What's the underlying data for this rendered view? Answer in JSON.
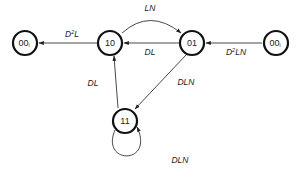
{
  "diagram": {
    "type": "state-transition-diagram",
    "nodes": [
      {
        "id": "n00_left",
        "label": "00",
        "subscript": "i",
        "x": 25,
        "y": 43
      },
      {
        "id": "n10",
        "label": "10",
        "subscript": "",
        "x": 110,
        "y": 43
      },
      {
        "id": "n01",
        "label": "01",
        "subscript": "",
        "x": 192,
        "y": 43
      },
      {
        "id": "n00_right",
        "label": "00",
        "subscript": "i",
        "x": 276,
        "y": 43
      },
      {
        "id": "n11",
        "label": "11",
        "subscript": "",
        "x": 125,
        "y": 121
      }
    ],
    "edges": [
      {
        "from": "10",
        "to": "00_i (left)",
        "label_base": "D",
        "label_sup": "2",
        "label_rest": "L"
      },
      {
        "from": "10",
        "to": "01",
        "label_base": "LN",
        "label_sup": "",
        "label_rest": "",
        "curved": true
      },
      {
        "from": "01",
        "to": "10",
        "label_base": "DL",
        "label_sup": "",
        "label_rest": ""
      },
      {
        "from": "00_i (right)",
        "to": "01",
        "label_base": "D",
        "label_sup": "2",
        "label_rest": "LN"
      },
      {
        "from": "01",
        "to": "11",
        "label_base": "DLN",
        "label_sup": "",
        "label_rest": ""
      },
      {
        "from": "11",
        "to": "10",
        "label_base": "DL",
        "label_sup": "",
        "label_rest": ""
      },
      {
        "from": "11",
        "to": "11",
        "label_base": "DLN",
        "label_sup": "",
        "label_rest": "",
        "self_loop": true
      }
    ]
  }
}
